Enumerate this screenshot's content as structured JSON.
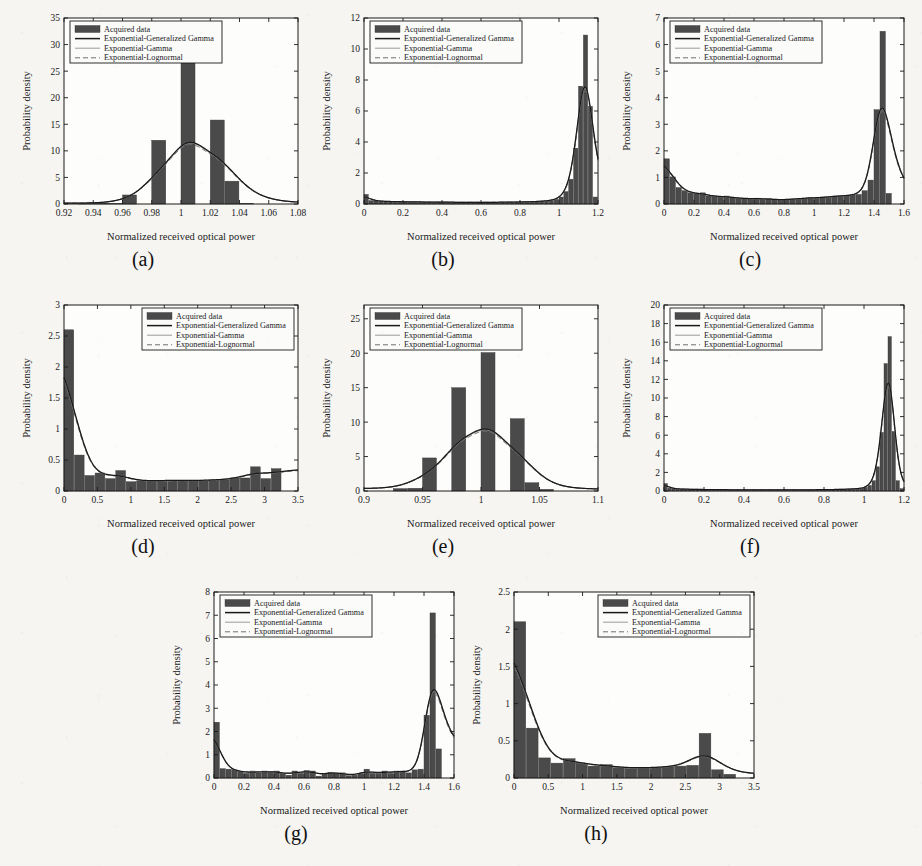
{
  "figure": {
    "background_color": "#f6f5f2",
    "bar_color": "#4a4a4a",
    "line_colors": {
      "exp_gen_gamma": "#1a1a1a",
      "exp_gamma": "#9a9a9a",
      "exp_lognormal": "#6f6f6f"
    },
    "common": {
      "xlabel": "Normalized received optical power",
      "ylabel": "Probability density",
      "legend": [
        "Acquired data",
        "Exponential-Generalized Gamma",
        "Exponential-Gamma",
        "Exponential-Lognormal"
      ]
    }
  },
  "chart_data": [
    {
      "id": "a",
      "caption": "(a)",
      "type": "bar",
      "title": "",
      "xlabel": "Normalized received optical power",
      "ylabel": "Probability density",
      "xlim": [
        0.92,
        1.08
      ],
      "ylim": [
        0,
        35
      ],
      "xticks": [
        0.92,
        0.94,
        0.96,
        0.98,
        1,
        1.02,
        1.04,
        1.06,
        1.08
      ],
      "xticklabels": [
        "0.92",
        "0.94",
        "0.96",
        "0.98",
        "1",
        "1.02",
        "1.04",
        "1.06",
        "1.08"
      ],
      "yticks": [
        0,
        5,
        10,
        15,
        20,
        25,
        30,
        35
      ],
      "yticklabels": [
        "0",
        "5",
        "10",
        "15",
        "20",
        "25",
        "30",
        "35"
      ],
      "grid": false,
      "legend_position": "upper-left",
      "bin_width": 0.01,
      "bin_left_edges": [
        0.93,
        0.94,
        0.95,
        0.96,
        0.97,
        0.98,
        0.99,
        1.0,
        1.01,
        1.02,
        1.03,
        1.04
      ],
      "values": [
        0.15,
        0.2,
        0.1,
        1.7,
        0.0,
        12.0,
        0.0,
        27.0,
        0.0,
        15.8,
        4.3,
        0.15
      ],
      "fit_peak_x": 1.0,
      "fit_peak_y": 25.7
    },
    {
      "id": "b",
      "caption": "(b)",
      "type": "bar",
      "title": "",
      "xlabel": "Normalized received optical power",
      "ylabel": "Probability density",
      "xlim": [
        0,
        1.2
      ],
      "ylim": [
        0,
        12
      ],
      "xticks": [
        0,
        0.2,
        0.4,
        0.6,
        0.8,
        1,
        1.2
      ],
      "xticklabels": [
        "0",
        "0.2",
        "0.4",
        "0.6",
        "0.8",
        "1",
        "1.2"
      ],
      "yticks": [
        0,
        2,
        4,
        6,
        8,
        10,
        12
      ],
      "yticklabels": [
        "0",
        "2",
        "4",
        "6",
        "8",
        "10",
        "12"
      ],
      "grid": false,
      "legend_position": "upper-left",
      "bin_width": 0.025,
      "bin_left_edges": [
        0,
        0.025,
        0.05,
        0.075,
        0.1,
        0.125,
        0.15,
        0.175,
        0.2,
        0.225,
        0.25,
        0.275,
        0.3,
        0.325,
        0.35,
        0.375,
        0.4,
        0.425,
        0.45,
        0.475,
        0.5,
        0.525,
        0.55,
        0.575,
        0.6,
        0.625,
        0.65,
        0.675,
        0.7,
        0.725,
        0.75,
        0.775,
        0.8,
        0.825,
        0.85,
        0.875,
        0.9,
        0.925,
        0.95,
        0.975,
        1.0,
        1.025,
        1.05,
        1.075,
        1.1,
        1.125,
        1.15,
        1.175
      ],
      "values": [
        0.62,
        0.22,
        0.2,
        0.18,
        0.17,
        0.16,
        0.15,
        0.15,
        0.14,
        0.14,
        0.13,
        0.13,
        0.13,
        0.12,
        0.12,
        0.12,
        0.12,
        0.12,
        0.11,
        0.11,
        0.11,
        0.11,
        0.11,
        0.11,
        0.11,
        0.11,
        0.11,
        0.11,
        0.12,
        0.12,
        0.12,
        0.13,
        0.13,
        0.14,
        0.15,
        0.16,
        0.18,
        0.2,
        0.24,
        0.3,
        0.45,
        0.8,
        1.6,
        3.6,
        7.6,
        10.9,
        6.3,
        0.45
      ],
      "fit_peak_x": 1.13,
      "fit_peak_y": 11.2
    },
    {
      "id": "c",
      "caption": "(c)",
      "type": "bar",
      "title": "",
      "xlabel": "Normalized received optical power",
      "ylabel": "Probability density",
      "xlim": [
        0,
        1.6
      ],
      "ylim": [
        0,
        7
      ],
      "xticks": [
        0,
        0.2,
        0.4,
        0.6,
        0.8,
        1,
        1.2,
        1.4,
        1.6
      ],
      "xticklabels": [
        "0",
        "0.2",
        "0.4",
        "0.6",
        "0.8",
        "1",
        "1.2",
        "1.4",
        "1.6"
      ],
      "yticks": [
        0,
        1,
        2,
        3,
        4,
        5,
        6,
        7
      ],
      "yticklabels": [
        "0",
        "1",
        "2",
        "3",
        "4",
        "5",
        "6",
        "7"
      ],
      "grid": false,
      "legend_position": "upper-left",
      "bin_width": 0.04,
      "bin_left_edges": [
        0,
        0.04,
        0.08,
        0.12,
        0.16,
        0.2,
        0.24,
        0.28,
        0.32,
        0.36,
        0.4,
        0.44,
        0.48,
        0.52,
        0.56,
        0.6,
        0.64,
        0.68,
        0.72,
        0.76,
        0.8,
        0.84,
        0.88,
        0.92,
        0.96,
        1.0,
        1.04,
        1.08,
        1.12,
        1.16,
        1.2,
        1.24,
        1.28,
        1.32,
        1.36,
        1.4,
        1.44,
        1.48
      ],
      "values": [
        1.7,
        1.02,
        0.62,
        0.5,
        0.42,
        0.38,
        0.42,
        0.3,
        0.3,
        0.26,
        0.3,
        0.24,
        0.22,
        0.2,
        0.2,
        0.22,
        0.18,
        0.2,
        0.16,
        0.16,
        0.17,
        0.18,
        0.2,
        0.22,
        0.24,
        0.22,
        0.26,
        0.26,
        0.3,
        0.3,
        0.32,
        0.34,
        0.36,
        0.5,
        0.9,
        3.55,
        6.5,
        0.4
      ],
      "fit_peak_x": 1.42,
      "fit_peak_y": 6.9
    },
    {
      "id": "d",
      "caption": "(d)",
      "type": "bar",
      "title": "",
      "xlabel": "Normalized received optical power",
      "ylabel": "Probability density",
      "xlim": [
        0,
        3.5
      ],
      "ylim": [
        0,
        3
      ],
      "xticks": [
        0,
        0.5,
        1,
        1.5,
        2,
        2.5,
        3,
        3.5
      ],
      "xticklabels": [
        "0",
        "0.5",
        "1",
        "1.5",
        "2",
        "2.5",
        "3",
        "3.5"
      ],
      "yticks": [
        0,
        0.5,
        1,
        1.5,
        2,
        2.5,
        3
      ],
      "yticklabels": [
        "0",
        "0.5",
        "1",
        "1.5",
        "2",
        "2.5",
        "3"
      ],
      "grid": false,
      "legend_position": "upper-right",
      "bin_width": 0.155,
      "bin_left_edges": [
        0,
        0.155,
        0.31,
        0.465,
        0.62,
        0.775,
        0.93,
        1.085,
        1.24,
        1.395,
        1.55,
        1.705,
        1.86,
        2.015,
        2.17,
        2.325,
        2.48,
        2.635,
        2.79,
        2.945,
        3.1
      ],
      "values": [
        2.6,
        0.58,
        0.25,
        0.29,
        0.2,
        0.33,
        0.15,
        0.16,
        0.17,
        0.17,
        0.17,
        0.17,
        0.17,
        0.17,
        0.18,
        0.18,
        0.21,
        0.21,
        0.39,
        0.2,
        0.36
      ],
      "fit_peak_x": 0.02,
      "fit_peak_y": 2.9
    },
    {
      "id": "e",
      "caption": "(e)",
      "type": "bar",
      "title": "",
      "xlabel": "Normalized received optical power",
      "ylabel": "Probability density",
      "xlim": [
        0.9,
        1.1
      ],
      "ylim": [
        0,
        27
      ],
      "xticks": [
        0.9,
        0.95,
        1,
        1.05,
        1.1
      ],
      "xticklabels": [
        "0.9",
        "0.95",
        "1",
        "1.05",
        "1.1"
      ],
      "yticks": [
        0,
        5,
        10,
        15,
        20,
        25
      ],
      "yticklabels": [
        "0",
        "5",
        "10",
        "15",
        "20",
        "25"
      ],
      "grid": false,
      "legend_position": "upper-left",
      "bin_width": 0.0125,
      "bin_left_edges": [
        0.925,
        0.9375,
        0.95,
        0.9625,
        0.975,
        0.9875,
        1.0,
        1.0125,
        1.025,
        1.0375,
        1.05
      ],
      "values": [
        0.35,
        0.4,
        4.8,
        0.0,
        15.0,
        0.0,
        20.1,
        0.0,
        10.5,
        1.2,
        0.25
      ],
      "fit_peak_x": 1.002,
      "fit_peak_y": 21.0
    },
    {
      "id": "f",
      "caption": "(f)",
      "type": "bar",
      "title": "",
      "xlabel": "Normalized received optical power",
      "ylabel": "Probability density",
      "xlim": [
        0,
        1.2
      ],
      "ylim": [
        0,
        20
      ],
      "xticks": [
        0,
        0.2,
        0.4,
        0.6,
        0.8,
        1,
        1.2
      ],
      "xticklabels": [
        "0",
        "0.2",
        "0.4",
        "0.6",
        "0.8",
        "1",
        "1.2"
      ],
      "yticks": [
        0,
        2,
        4,
        6,
        8,
        10,
        12,
        14,
        16,
        18,
        20
      ],
      "yticklabels": [
        "0",
        "2",
        "4",
        "6",
        "8",
        "10",
        "12",
        "14",
        "16",
        "18",
        "20"
      ],
      "grid": false,
      "legend_position": "upper-left",
      "bin_width": 0.02,
      "bin_left_edges": [
        0,
        0.02,
        0.04,
        0.06,
        0.08,
        0.1,
        0.12,
        0.14,
        0.16,
        0.18,
        0.2,
        0.22,
        0.24,
        0.26,
        0.28,
        0.3,
        0.32,
        0.34,
        0.36,
        0.38,
        0.4,
        0.42,
        0.44,
        0.46,
        0.48,
        0.5,
        0.52,
        0.54,
        0.56,
        0.58,
        0.6,
        0.62,
        0.64,
        0.66,
        0.68,
        0.7,
        0.72,
        0.74,
        0.76,
        0.78,
        0.8,
        0.82,
        0.84,
        0.86,
        0.88,
        0.9,
        0.92,
        0.94,
        0.96,
        0.98,
        1.0,
        1.02,
        1.04,
        1.06,
        1.08,
        1.1,
        1.12,
        1.14,
        1.16,
        1.18
      ],
      "values": [
        0.8,
        0.3,
        0.25,
        0.22,
        0.2,
        0.2,
        0.18,
        0.18,
        0.17,
        0.16,
        0.16,
        0.15,
        0.15,
        0.14,
        0.14,
        0.14,
        0.13,
        0.13,
        0.13,
        0.12,
        0.12,
        0.12,
        0.12,
        0.12,
        0.12,
        0.12,
        0.12,
        0.12,
        0.12,
        0.12,
        0.12,
        0.12,
        0.12,
        0.12,
        0.13,
        0.13,
        0.13,
        0.13,
        0.14,
        0.14,
        0.15,
        0.15,
        0.16,
        0.17,
        0.18,
        0.19,
        0.2,
        0.22,
        0.25,
        0.3,
        0.4,
        0.6,
        1.1,
        2.6,
        6.3,
        13.7,
        16.6,
        6.4,
        1.1,
        0.25
      ],
      "fit_peak_x": 1.125,
      "fit_peak_y": 16.9
    },
    {
      "id": "g",
      "caption": "(g)",
      "type": "bar",
      "title": "",
      "xlabel": "Normalized received optical power",
      "ylabel": "Probability density",
      "xlim": [
        0,
        1.6
      ],
      "ylim": [
        0,
        8
      ],
      "xticks": [
        0,
        0.2,
        0.4,
        0.6,
        0.8,
        1,
        1.2,
        1.4,
        1.6
      ],
      "xticklabels": [
        "0",
        "0.2",
        "0.4",
        "0.6",
        "0.8",
        "1",
        "1.2",
        "1.4",
        "1.6"
      ],
      "yticks": [
        0,
        1,
        2,
        3,
        4,
        5,
        6,
        7,
        8
      ],
      "yticklabels": [
        "0",
        "1",
        "2",
        "3",
        "4",
        "5",
        "6",
        "7",
        "8"
      ],
      "grid": false,
      "legend_position": "upper-left",
      "bin_width": 0.04,
      "bin_left_edges": [
        0,
        0.04,
        0.08,
        0.12,
        0.16,
        0.2,
        0.24,
        0.28,
        0.32,
        0.36,
        0.4,
        0.44,
        0.48,
        0.52,
        0.56,
        0.6,
        0.64,
        0.68,
        0.72,
        0.76,
        0.8,
        0.84,
        0.88,
        0.92,
        0.96,
        1.0,
        1.04,
        1.08,
        1.12,
        1.16,
        1.2,
        1.24,
        1.28,
        1.32,
        1.36,
        1.4,
        1.44,
        1.48
      ],
      "values": [
        2.4,
        0.4,
        0.38,
        0.35,
        0.28,
        0.2,
        0.3,
        0.22,
        0.3,
        0.25,
        0.3,
        0.2,
        0.12,
        0.3,
        0.2,
        0.32,
        0.3,
        0.08,
        0.2,
        0.25,
        0.2,
        0.22,
        0.1,
        0.12,
        0.2,
        0.38,
        0.2,
        0.2,
        0.3,
        0.2,
        0.3,
        0.3,
        0.22,
        0.35,
        0.38,
        2.7,
        7.1,
        1.25
      ],
      "fit_peak_x": 1.43,
      "fit_peak_y": 7.3
    },
    {
      "id": "h",
      "caption": "(h)",
      "type": "bar",
      "title": "",
      "xlabel": "Normalized received optical power",
      "ylabel": "Probability density",
      "xlim": [
        0,
        3.5
      ],
      "ylim": [
        0,
        2.5
      ],
      "xticks": [
        0,
        0.5,
        1,
        1.5,
        2,
        2.5,
        3,
        3.5
      ],
      "xticklabels": [
        "0",
        "0.5",
        "1",
        "1.5",
        "2",
        "2.5",
        "3",
        "3.5"
      ],
      "yticks": [
        0,
        0.5,
        1,
        1.5,
        2,
        2.5
      ],
      "yticklabels": [
        "0",
        "0.5",
        "1",
        "1.5",
        "2",
        "2.5"
      ],
      "grid": false,
      "legend_position": "upper-right",
      "bin_width": 0.18,
      "bin_left_edges": [
        0,
        0.18,
        0.36,
        0.54,
        0.72,
        0.9,
        1.08,
        1.26,
        1.44,
        1.62,
        1.8,
        1.98,
        2.16,
        2.34,
        2.52,
        2.7,
        2.88,
        3.06
      ],
      "values": [
        2.1,
        0.67,
        0.27,
        0.2,
        0.26,
        0.2,
        0.16,
        0.18,
        0.14,
        0.13,
        0.14,
        0.14,
        0.15,
        0.16,
        0.17,
        0.6,
        0.11,
        0.05
      ],
      "fit_peak_x": 0.05,
      "fit_peak_y": 2.35
    }
  ]
}
